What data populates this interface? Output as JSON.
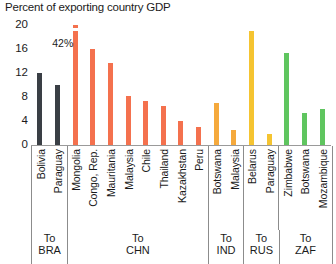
{
  "chart_data": {
    "type": "bar",
    "title": "Percent of exporting country GDP",
    "xlabel": "",
    "ylabel": "",
    "ylim": [
      0,
      20
    ],
    "yticks": [
      20,
      16,
      12,
      8,
      4,
      0
    ],
    "grid": false,
    "legend": "none",
    "categories": [
      "Bolivia",
      "Paraguay",
      "Mongolia",
      "Congo, Rep.",
      "Mauritania",
      "Malaysia",
      "Chile",
      "Thailand",
      "Kazakhstan",
      "Peru",
      "Botswana",
      "Malaysia",
      "Belarus",
      "Paraguay",
      "Zimbabwe",
      "Botswana",
      "Mozambique"
    ],
    "values": [
      12.0,
      10.0,
      42.0,
      16.0,
      13.6,
      8.2,
      7.3,
      6.5,
      4.0,
      3.0,
      7.0,
      2.5,
      19.0,
      1.8,
      15.3,
      5.4,
      6.0
    ],
    "bar_colors": [
      "#3a3f45",
      "#3a3f45",
      "#f4714e",
      "#f4714e",
      "#f4714e",
      "#f4714e",
      "#f4714e",
      "#f4714e",
      "#f4714e",
      "#f4714e",
      "#f5a93c",
      "#f5a93c",
      "#f5c431",
      "#f5c431",
      "#5fc55f",
      "#5fc55f",
      "#5fc55f"
    ],
    "clipped": [
      false,
      false,
      true,
      false,
      false,
      false,
      false,
      false,
      false,
      false,
      false,
      false,
      false,
      false,
      false,
      false,
      false
    ],
    "annotations": [
      {
        "index": 2,
        "text": "42%"
      }
    ],
    "groups": [
      {
        "label_top": "To",
        "label_bottom": "BRA",
        "span": 2
      },
      {
        "label_top": "To",
        "label_bottom": "CHN",
        "span": 8
      },
      {
        "label_top": "To",
        "label_bottom": "IND",
        "span": 2
      },
      {
        "label_top": "To",
        "label_bottom": "RUS",
        "span": 2
      },
      {
        "label_top": "To",
        "label_bottom": "ZAF",
        "span": 3
      }
    ]
  }
}
